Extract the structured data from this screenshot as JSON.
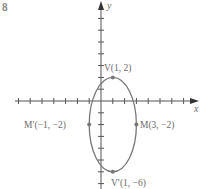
{
  "problem_number": "8",
  "axes": {
    "x_label": "x",
    "y_label": "y",
    "origin_px": [
      101,
      101
    ],
    "unit_px": 11.8,
    "color": "#555555"
  },
  "ellipse": {
    "center": [
      1,
      -2
    ],
    "semi_axis_x": 2,
    "semi_axis_y": 4,
    "color": "#777777"
  },
  "points": [
    {
      "name": "V",
      "label": "V(1, 2)",
      "x": 1,
      "y": 2
    },
    {
      "name": "V-prime",
      "label": "V′(1, −6)",
      "x": 1,
      "y": -6
    },
    {
      "name": "M",
      "label": "M(3, −2)",
      "x": 3,
      "y": -2
    },
    {
      "name": "M-prime",
      "label": "M′(−1, −2)",
      "x": -1,
      "y": -2
    }
  ]
}
